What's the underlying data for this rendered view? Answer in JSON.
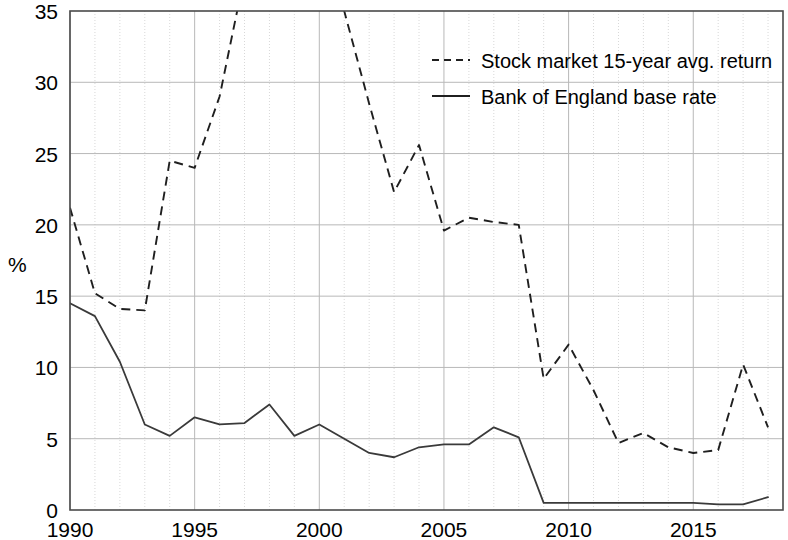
{
  "chart_data": {
    "type": "line",
    "title": "",
    "xlabel": "",
    "ylabel": "%",
    "xlim": [
      1990,
      2018.6
    ],
    "ylim": [
      0,
      35
    ],
    "yticks": [
      0,
      5,
      10,
      15,
      20,
      25,
      30,
      35
    ],
    "xticks": [
      1990,
      1995,
      2000,
      2005,
      2010,
      2015
    ],
    "xtick_labels": [
      "1990",
      "1995",
      "2000",
      "2005",
      "2010",
      "2015"
    ],
    "ytick_labels": [
      "0",
      "5",
      "10",
      "15",
      "20",
      "25",
      "30",
      "35"
    ],
    "grid": true,
    "grid_minor_x": true,
    "legend_position": "top-right",
    "x": [
      1990,
      1991,
      1992,
      1993,
      1994,
      1995,
      1996,
      1997,
      1998,
      1999,
      2000,
      2001,
      2002,
      2003,
      2004,
      2005,
      2006,
      2007,
      2008,
      2009,
      2010,
      2011,
      2012,
      2013,
      2014,
      2015,
      2016,
      2017,
      2018
    ],
    "series": [
      {
        "name": "Stock market 15-year avg. return",
        "style": "dashed",
        "color": "#1f1f1f",
        "clipped_above": 35,
        "values": [
          21.2,
          15.2,
          14.1,
          14.0,
          24.5,
          24.0,
          29.0,
          37.5,
          44.0,
          48.0,
          44.0,
          35.0,
          28.5,
          22.3,
          25.6,
          19.6,
          20.5,
          20.2,
          20.0,
          9.2,
          11.6,
          8.4,
          4.7,
          5.4,
          4.4,
          4.0,
          4.2,
          10.2,
          5.8
        ]
      },
      {
        "name": "Bank of England base rate",
        "style": "solid",
        "color": "#3a3a3a",
        "values": [
          14.5,
          13.6,
          10.4,
          6.0,
          5.2,
          6.5,
          6.0,
          6.1,
          7.4,
          5.2,
          6.0,
          5.0,
          4.0,
          3.7,
          4.4,
          4.6,
          4.6,
          5.8,
          5.1,
          0.5,
          0.5,
          0.5,
          0.5,
          0.5,
          0.5,
          0.5,
          0.4,
          0.4,
          0.9
        ]
      }
    ]
  },
  "legend": {
    "items": [
      {
        "label": "Stock market 15-year avg. return",
        "style": "dashed"
      },
      {
        "label": "Bank of England base rate",
        "style": "solid"
      }
    ]
  },
  "axis": {
    "y_title": "%"
  }
}
